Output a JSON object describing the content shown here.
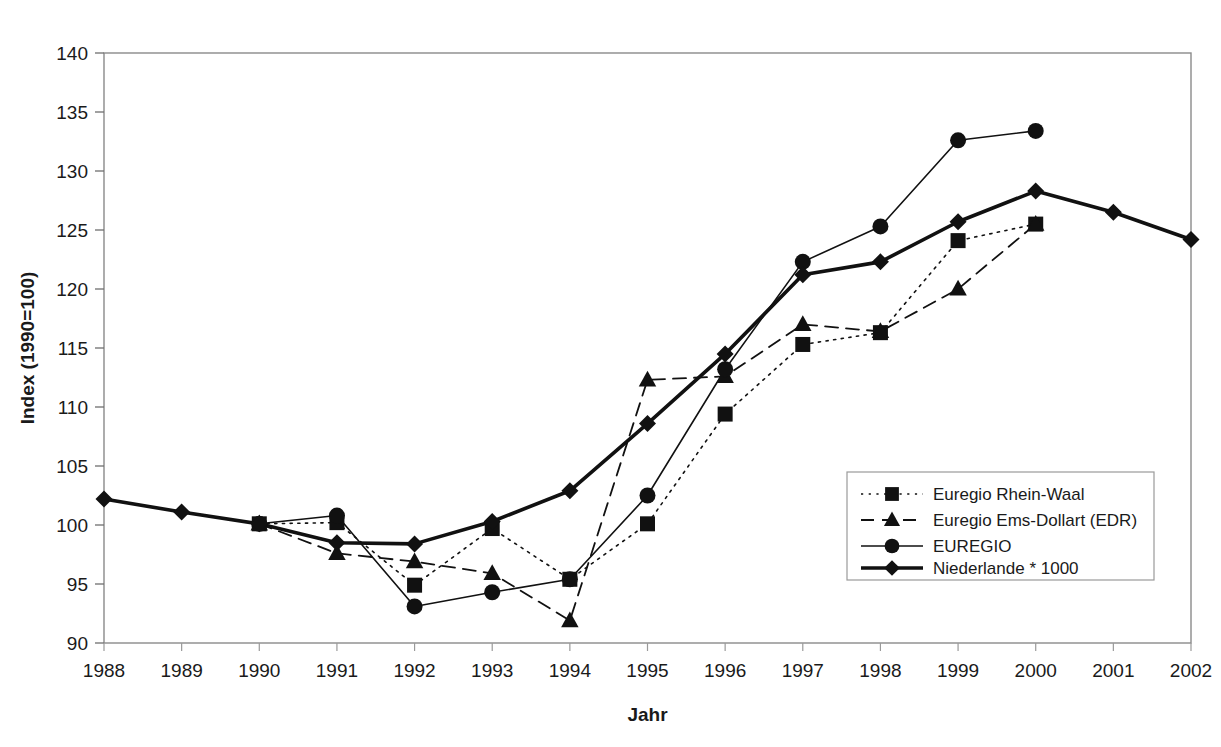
{
  "chart_data": {
    "type": "line",
    "title": "",
    "xlabel": "Jahr",
    "ylabel": "Index (1990=100)",
    "xticks": [
      "1988",
      "1989",
      "1990",
      "1991",
      "1992",
      "1993",
      "1994",
      "1995",
      "1996",
      "1997",
      "1998",
      "1999",
      "2000",
      "2001",
      "2002"
    ],
    "yticks": [
      "90",
      "95",
      "100",
      "105",
      "110",
      "115",
      "120",
      "125",
      "130",
      "135",
      "140"
    ],
    "ylim": [
      90,
      140
    ],
    "xlim": [
      1988,
      2002
    ],
    "grid": false,
    "legend_position": "inside-bottom-right",
    "x": [
      1988,
      1989,
      1990,
      1991,
      1992,
      1993,
      1994,
      1995,
      1996,
      1997,
      1998,
      1999,
      2000,
      2001,
      2002
    ],
    "series": [
      {
        "name": "Euregio Rhein-Waal",
        "marker": "square",
        "line_style": "dotted",
        "line_width": 1.6,
        "x": [
          1990,
          1991,
          1992,
          1993,
          1994,
          1995,
          1996,
          1997,
          1998,
          1999,
          2000
        ],
        "values": [
          100.1,
          100.2,
          94.9,
          99.7,
          95.4,
          100.1,
          109.4,
          115.3,
          116.3,
          124.1,
          125.5
        ]
      },
      {
        "name": "Euregio Ems-Dollart (EDR)",
        "marker": "triangle",
        "line_style": "dashed",
        "line_width": 1.8,
        "x": [
          1990,
          1991,
          1992,
          1993,
          1994,
          1995,
          1996,
          1997,
          1998,
          1999,
          2000
        ],
        "values": [
          100.1,
          97.6,
          96.9,
          95.9,
          91.9,
          112.3,
          112.6,
          117.0,
          116.4,
          120.0,
          125.5
        ]
      },
      {
        "name": "EUREGIO",
        "marker": "circle",
        "line_style": "solid",
        "line_width": 1.6,
        "x": [
          1990,
          1991,
          1992,
          1993,
          1994,
          1995,
          1996,
          1997,
          1998,
          1999,
          2000
        ],
        "values": [
          100.1,
          100.8,
          93.1,
          94.3,
          95.4,
          102.5,
          113.2,
          122.3,
          125.3,
          132.6,
          133.4
        ]
      },
      {
        "name": "Niederlande * 1000",
        "marker": "diamond",
        "line_style": "solid",
        "line_width": 3.6,
        "x": [
          1988,
          1989,
          1990,
          1991,
          1992,
          1993,
          1994,
          1995,
          1996,
          1997,
          1998,
          1999,
          2000,
          2001,
          2002
        ],
        "values": [
          102.2,
          101.1,
          100.1,
          98.5,
          98.4,
          100.3,
          102.9,
          108.6,
          114.5,
          121.2,
          122.3,
          125.7,
          128.3,
          126.5,
          124.2
        ]
      }
    ]
  },
  "legend": {
    "items": [
      {
        "label": "Euregio Rhein-Waal"
      },
      {
        "label": "Euregio Ems-Dollart (EDR)"
      },
      {
        "label": "EUREGIO"
      },
      {
        "label": "Niederlande * 1000"
      }
    ]
  },
  "colors": {
    "ink": "#111111",
    "frame": "#8a8a8a",
    "background": "#ffffff"
  }
}
